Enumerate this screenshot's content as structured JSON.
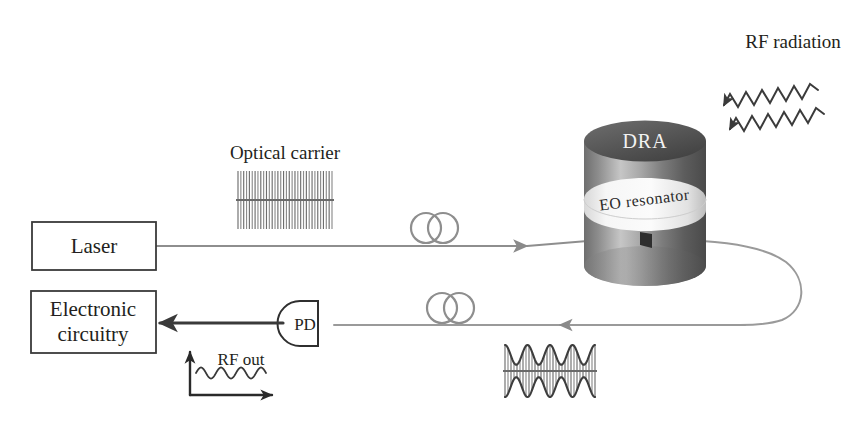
{
  "figure": {
    "background": "#ffffff"
  },
  "colors": {
    "ink": "#231f20",
    "fiber": "#8e8e8e",
    "electrical": "#3a3a3a",
    "cylinder_dark": "#565656",
    "cylinder_light": "#cfcfcf",
    "eo_band": "#f4f4f4",
    "dra_text": "#f2f2f2"
  },
  "blocks": {
    "laser": {
      "label": "Laser",
      "x": 32,
      "y": 222,
      "w": 124,
      "h": 48
    },
    "electronics": {
      "label_line1": "Electronic",
      "label_line2": "circuitry",
      "x": 31,
      "y": 291,
      "w": 125,
      "h": 62
    },
    "photodetector": {
      "label": "PD",
      "cx": 307,
      "cy": 323,
      "r": 23
    }
  },
  "labels": {
    "optical_carrier": "Optical carrier",
    "rf_radiation": "RF radiation",
    "rf_out": "RF out",
    "dra": "DRA",
    "eo_resonator": "EO resonator"
  },
  "components": {
    "cylinder": {
      "name": "dielectric-resonator-antenna",
      "cx": 645,
      "top_y": 141,
      "bottom_y": 266,
      "rx": 61,
      "ry": 20
    },
    "fiber_coils": [
      {
        "name": "upper-fiber-coil",
        "cx": 434,
        "cy": 227,
        "r": 15
      },
      {
        "name": "lower-fiber-coil",
        "cx": 450,
        "cy": 307,
        "r": 15
      }
    ],
    "coupling_prism": {
      "x": 641,
      "y": 232,
      "w": 11,
      "h": 15
    }
  },
  "waveforms": {
    "optical_carrier": {
      "name": "optical-carrier-comb",
      "type": "dense-uniform-comb",
      "x": 238,
      "y": 171,
      "w": 94,
      "h": 58,
      "teeth": 33,
      "description": "unmodulated high-frequency optical carrier, constant amplitude"
    },
    "modulated_signal": {
      "name": "modulated-optical-signal",
      "type": "amplitude-modulated-comb",
      "x": 505,
      "y": 345,
      "w": 90,
      "h": 52,
      "teeth": 30,
      "envelope_lobes": 4,
      "description": "optical carrier with RF amplitude modulation envelope"
    },
    "rf_out_plot": {
      "name": "rf-out-inset-plot",
      "origin_x": 190,
      "origin_y": 395,
      "y_axis_top": 352,
      "x_axis_right": 272,
      "wave_cycles": 3.5
    },
    "rf_radiation": {
      "name": "rf-radiation-waves",
      "arrows": 2,
      "direction": "down-left",
      "cycles": 6
    }
  },
  "paths": {
    "laser_to_resonator": "horizontal fiber from laser right edge to coupling prism",
    "resonator_to_pd": "fiber from prism, loops right, returns leftward to photodetector",
    "pd_to_electronics": "electrical arrow from PD to electronic circuitry"
  }
}
